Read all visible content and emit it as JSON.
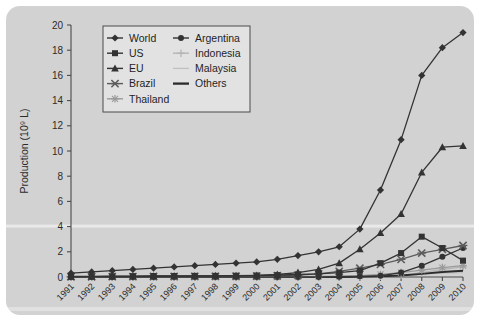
{
  "figure": {
    "panel_color": "#d2d2d2",
    "plot_bg": "#d2d2d2",
    "legend_bg": "#e2e2e2",
    "axis_color": "#4a4a4a"
  },
  "chart_data": {
    "type": "line",
    "title": "",
    "xlabel": "",
    "ylabel": "Production (10⁹ L)",
    "ylim": [
      0,
      20
    ],
    "yticks": [
      0,
      2,
      4,
      6,
      8,
      10,
      12,
      14,
      16,
      18,
      20
    ],
    "ytick_labels": [
      "0",
      "2",
      "4",
      "6",
      "8",
      "10",
      "12",
      "14",
      "16",
      "18",
      "20"
    ],
    "grid": false,
    "legend_position": "upper-left-inside",
    "categories": [
      "1991",
      "1992",
      "1993",
      "1994",
      "1995",
      "1996",
      "1997",
      "1998",
      "1999",
      "2000",
      "2001",
      "2002",
      "2003",
      "2004",
      "2005",
      "2006",
      "2007",
      "2008",
      "2009",
      "2010"
    ],
    "x": [
      1991,
      1992,
      1993,
      1994,
      1995,
      1996,
      1997,
      1998,
      1999,
      2000,
      2001,
      2002,
      2003,
      2004,
      2005,
      2006,
      2007,
      2008,
      2009,
      2010
    ],
    "series": [
      {
        "name": "World",
        "marker": "diamond",
        "color": "#333333",
        "values": [
          0.3,
          0.4,
          0.5,
          0.6,
          0.7,
          0.8,
          0.9,
          1.0,
          1.1,
          1.2,
          1.4,
          1.7,
          2.0,
          2.4,
          3.8,
          6.9,
          10.9,
          16.0,
          18.2,
          19.4
        ]
      },
      {
        "name": "US",
        "marker": "square",
        "color": "#333333",
        "values": [
          0.05,
          0.05,
          0.06,
          0.07,
          0.08,
          0.08,
          0.09,
          0.09,
          0.1,
          0.12,
          0.15,
          0.2,
          0.25,
          0.35,
          0.5,
          1.1,
          1.9,
          3.2,
          2.3,
          1.3
        ]
      },
      {
        "name": "EU",
        "marker": "triangle",
        "color": "#333333",
        "values": [
          0.02,
          0.03,
          0.04,
          0.05,
          0.06,
          0.07,
          0.08,
          0.09,
          0.1,
          0.12,
          0.2,
          0.35,
          0.6,
          1.1,
          2.2,
          3.5,
          5.0,
          8.3,
          10.3,
          10.4
        ]
      },
      {
        "name": "Brazil",
        "marker": "cross-x",
        "color": "#5c5c5c",
        "values": [
          0.02,
          0.02,
          0.03,
          0.03,
          0.04,
          0.04,
          0.05,
          0.05,
          0.06,
          0.07,
          0.1,
          0.15,
          0.25,
          0.45,
          0.7,
          1.0,
          1.4,
          1.9,
          2.2,
          2.5
        ]
      },
      {
        "name": "Thailand",
        "marker": "star",
        "color": "#9a9a9a",
        "values": [
          0.0,
          0.0,
          0.0,
          0.0,
          0.0,
          0.0,
          0.0,
          0.0,
          0.0,
          0.0,
          0.0,
          0.02,
          0.04,
          0.06,
          0.1,
          0.2,
          0.35,
          0.55,
          0.75,
          0.9
        ]
      },
      {
        "name": "Argentina",
        "marker": "circle",
        "color": "#333333",
        "values": [
          0.0,
          0.0,
          0.0,
          0.0,
          0.0,
          0.0,
          0.0,
          0.0,
          0.0,
          0.0,
          0.0,
          0.0,
          0.0,
          0.02,
          0.05,
          0.1,
          0.35,
          0.9,
          1.6,
          2.3
        ]
      },
      {
        "name": "Indonesia",
        "marker": "plus",
        "color": "#b5b5b5",
        "values": [
          0.0,
          0.0,
          0.0,
          0.0,
          0.0,
          0.0,
          0.0,
          0.0,
          0.0,
          0.0,
          0.0,
          0.0,
          0.0,
          0.0,
          0.02,
          0.06,
          0.15,
          0.35,
          0.6,
          0.8
        ]
      },
      {
        "name": "Malaysia",
        "marker": "line",
        "color": "#c0c0c0",
        "values": [
          0.0,
          0.0,
          0.0,
          0.0,
          0.0,
          0.0,
          0.0,
          0.0,
          0.0,
          0.0,
          0.0,
          0.0,
          0.0,
          0.0,
          0.01,
          0.03,
          0.08,
          0.2,
          0.3,
          0.35
        ]
      },
      {
        "name": "Others",
        "marker": "line-bold",
        "color": "#2b2b2b",
        "values": [
          0.0,
          0.0,
          0.0,
          0.0,
          0.0,
          0.0,
          0.0,
          0.0,
          0.0,
          0.0,
          0.0,
          0.0,
          0.0,
          0.0,
          0.02,
          0.05,
          0.12,
          0.25,
          0.4,
          0.5
        ]
      }
    ],
    "legend": [
      {
        "label": "World",
        "marker": "diamond",
        "color": "#333333"
      },
      {
        "label": "US",
        "marker": "square",
        "color": "#333333"
      },
      {
        "label": "EU",
        "marker": "triangle",
        "color": "#333333"
      },
      {
        "label": "Brazil",
        "marker": "cross-x",
        "color": "#5c5c5c"
      },
      {
        "label": "Thailand",
        "marker": "star",
        "color": "#9a9a9a"
      },
      {
        "label": "Argentina",
        "marker": "circle",
        "color": "#333333"
      },
      {
        "label": "Indonesia",
        "marker": "plus",
        "color": "#b5b5b5"
      },
      {
        "label": "Malaysia",
        "marker": "line",
        "color": "#c0c0c0"
      },
      {
        "label": "Others",
        "marker": "line-bold",
        "color": "#2b2b2b"
      }
    ]
  }
}
